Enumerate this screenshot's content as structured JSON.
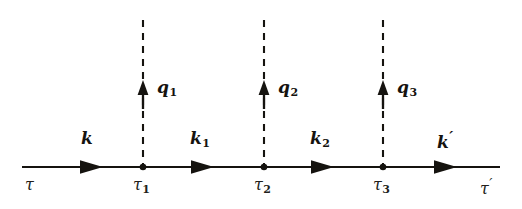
{
  "figure": {
    "kind": "feynman-diagram",
    "background_color": "#ffffff",
    "ink_color": "#15130f"
  },
  "propagator": {
    "name": "fermion-line",
    "style": "solid",
    "start_x": 22,
    "end_x": 500,
    "y": 167,
    "segments": [
      {
        "id": "seg-k",
        "label": "k",
        "subscript": "",
        "prime": false,
        "label_x": 88,
        "label_y": 137,
        "arrow_x": 94
      },
      {
        "id": "seg-k1",
        "label": "k",
        "subscript": "1",
        "prime": false,
        "label_x": 198,
        "label_y": 137,
        "arrow_x": 205
      },
      {
        "id": "seg-k2",
        "label": "k",
        "subscript": "2",
        "prime": false,
        "label_x": 318,
        "label_y": 137,
        "arrow_x": 325
      },
      {
        "id": "seg-kp",
        "label": "k",
        "subscript": "",
        "prime": true,
        "label_x": 443,
        "label_y": 137,
        "arrow_x": 448
      }
    ]
  },
  "interactions": {
    "name": "dashed-interaction-lines",
    "style": "dashed",
    "top_y": 20,
    "lines": [
      {
        "id": "q1",
        "label": "q",
        "subscript": "1",
        "x": 143,
        "label_x": 158,
        "label_y": 80,
        "arrow_tip_y": 82,
        "arrow_tail_y": 108
      },
      {
        "id": "q2",
        "label": "q",
        "subscript": "2",
        "x": 264,
        "label_x": 279,
        "label_y": 80,
        "arrow_tip_y": 82,
        "arrow_tail_y": 108
      },
      {
        "id": "q3",
        "label": "q",
        "subscript": "3",
        "x": 383,
        "label_x": 398,
        "label_y": 80,
        "arrow_tip_y": 82,
        "arrow_tail_y": 108
      }
    ]
  },
  "vertices": [
    {
      "id": "v1",
      "x": 143,
      "y": 167
    },
    {
      "id": "v2",
      "x": 264,
      "y": 167
    },
    {
      "id": "v3",
      "x": 383,
      "y": 167
    }
  ],
  "time_labels": [
    {
      "id": "tau",
      "label": "τ",
      "subscript": "",
      "prime": false,
      "x": 30,
      "y": 180
    },
    {
      "id": "tau1",
      "label": "τ",
      "subscript": "1",
      "prime": false,
      "x": 135,
      "y": 180
    },
    {
      "id": "tau2",
      "label": "τ",
      "subscript": "2",
      "prime": false,
      "x": 256,
      "y": 180
    },
    {
      "id": "tau3",
      "label": "τ",
      "subscript": "3",
      "prime": false,
      "x": 375,
      "y": 180
    },
    {
      "id": "taup",
      "label": "τ",
      "subscript": "",
      "prime": true,
      "x": 482,
      "y": 180
    }
  ]
}
